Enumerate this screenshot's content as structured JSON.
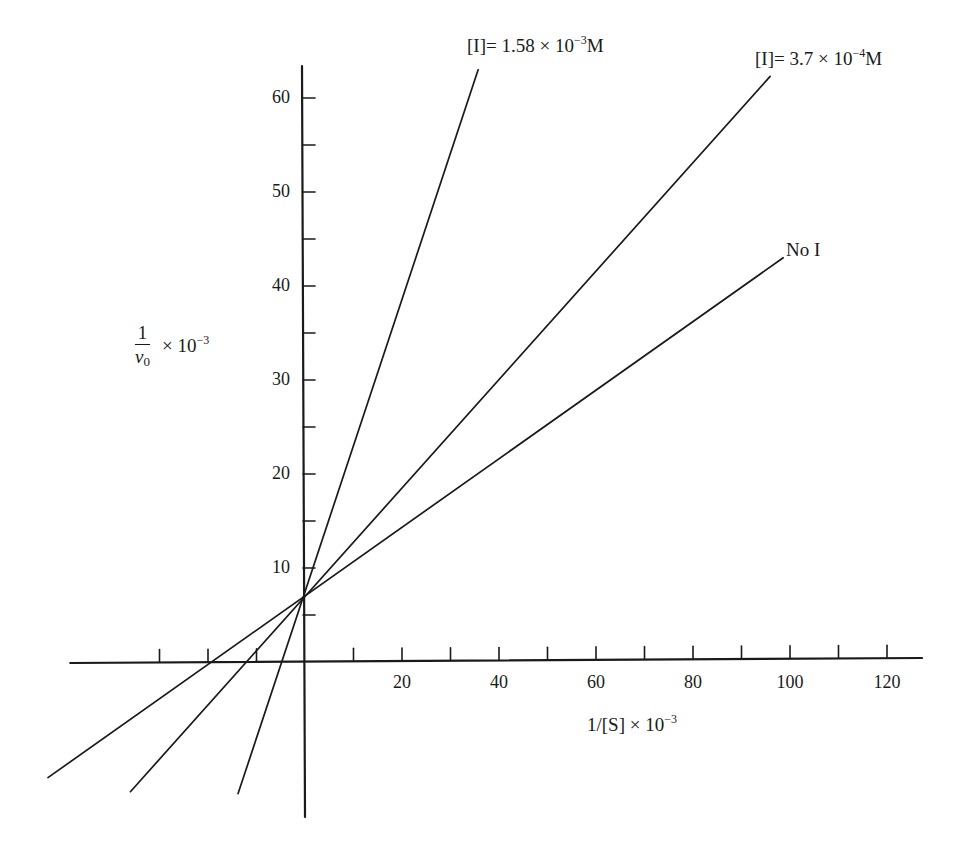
{
  "chart_data": {
    "type": "line",
    "title": "",
    "xlabel": "1/[S] × 10⁻³",
    "ylabel": "1/v₀ × 10⁻³",
    "xlim": [
      -55,
      127
    ],
    "ylim": [
      -16,
      63
    ],
    "x_ticks": [
      -30,
      -20,
      -10,
      10,
      20,
      30,
      40,
      50,
      60,
      70,
      80,
      90,
      100,
      110,
      120
    ],
    "x_tick_labels": [
      "20",
      "40",
      "60",
      "80",
      "100",
      "120"
    ],
    "x_tick_label_values": [
      20,
      40,
      60,
      80,
      100,
      120
    ],
    "y_ticks": [
      5,
      10,
      15,
      20,
      25,
      30,
      35,
      40,
      45,
      50,
      55,
      60
    ],
    "y_tick_labels": [
      "10",
      "20",
      "30",
      "40",
      "50",
      "60"
    ],
    "y_tick_label_values": [
      10,
      20,
      30,
      40,
      50,
      60
    ],
    "grid": false,
    "legend": "none (lines labeled directly)",
    "series": [
      {
        "name": "[I] = 1.58 × 10⁻³ M",
        "label_main": "[I]= 1.58 × 10",
        "label_exp": "−3",
        "label_unit": "M",
        "y_intercept": 7,
        "x_intercept": -4.5,
        "slope": 1.57,
        "x": [
          -13.8,
          35.7
        ],
        "y": [
          -14.0,
          63.0
        ]
      },
      {
        "name": "[I] = 3.7 × 10⁻⁴ M",
        "label_main": "[I]= 3.7 × 10",
        "label_exp": "−4",
        "label_unit": "M",
        "y_intercept": 7,
        "x_intercept": -12.1,
        "slope": 0.577,
        "x": [
          -36.0,
          95.9
        ],
        "y": [
          -13.8,
          62.3
        ]
      },
      {
        "name": "No I",
        "label_main": "No I",
        "label_exp": "",
        "label_unit": "",
        "y_intercept": 7,
        "x_intercept": -19.2,
        "slope": 0.365,
        "x": [
          -53.0,
          98.6
        ],
        "y": [
          -12.3,
          43.0
        ]
      }
    ],
    "annotations": [
      "Lineweaver–Burk plot: competitive inhibition, lines share common y-intercept ≈ 7"
    ]
  },
  "axis_labels": {
    "y_num": "1",
    "y_den": "v",
    "y_den_sub": "0",
    "y_mult": "× 10",
    "y_exp": "−3",
    "x_main": "1/[S] × 10",
    "x_exp": "−3"
  },
  "colors": {
    "ink": "#1a1a1a",
    "background": "#ffffff"
  }
}
